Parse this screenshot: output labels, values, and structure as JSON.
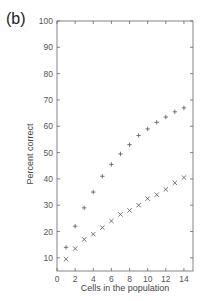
{
  "panel_label": "(b)",
  "chart_data": {
    "type": "scatter",
    "title": "",
    "xlabel": "Cells in the population",
    "ylabel": "Percent correct",
    "xlim": [
      0,
      15
    ],
    "ylim": [
      5,
      100
    ],
    "xticks": [
      0,
      2,
      4,
      6,
      8,
      10,
      12,
      14
    ],
    "yticks": [
      10,
      20,
      30,
      40,
      50,
      60,
      70,
      80,
      90,
      100
    ],
    "grid": false,
    "legend": null,
    "series": [
      {
        "name": "plus-markers",
        "marker": "+",
        "x": [
          1,
          2,
          3,
          4,
          5,
          6,
          7,
          8,
          9,
          10,
          11,
          12,
          13,
          14
        ],
        "values": [
          14,
          22,
          29,
          35,
          41,
          45.5,
          49.5,
          53,
          56.5,
          59,
          61.5,
          63.5,
          65.5,
          67
        ]
      },
      {
        "name": "cross-markers",
        "marker": "x",
        "x": [
          1,
          2,
          3,
          4,
          5,
          6,
          7,
          8,
          9,
          10,
          11,
          12,
          13,
          14
        ],
        "values": [
          9.5,
          13.5,
          17,
          19,
          21.5,
          24,
          26.5,
          28,
          30,
          32.5,
          34,
          36,
          38.5,
          40.5
        ]
      }
    ]
  },
  "colors": {
    "axis": "#666666",
    "marker": "#555555",
    "text": "#444444"
  }
}
